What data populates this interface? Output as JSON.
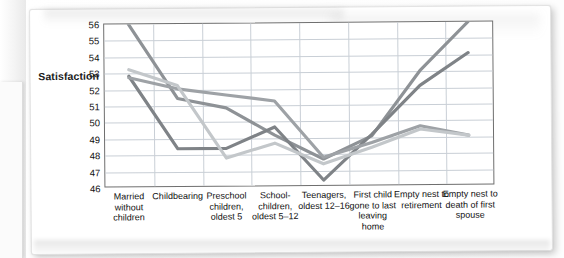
{
  "axis_title": "Satisfaction",
  "chart_data": {
    "type": "line",
    "title": "",
    "xlabel": "",
    "ylabel": "Satisfaction",
    "ylim": [
      46,
      56
    ],
    "yticks": [
      46,
      47,
      48,
      49,
      50,
      51,
      52,
      53,
      54,
      55,
      56
    ],
    "grid": true,
    "legend": "none",
    "categories": [
      "Married without children",
      "Childbearing",
      "Preschool children, oldest 5",
      "School-children, oldest 5–12",
      "Teenagers, oldest 12–16",
      "First child gone to last leaving home",
      "Empty nest to retirement",
      "Empty nest to death of first spouse"
    ],
    "series": [
      {
        "name": "series-1",
        "color": "#8e9296",
        "values": [
          56.0,
          51.4,
          50.8,
          49.1,
          47.6,
          49.0,
          53.0,
          56.0
        ]
      },
      {
        "name": "series-2",
        "color": "#7f8387",
        "values": [
          52.8,
          48.3,
          48.3,
          49.6,
          46.3,
          49.1,
          52.1,
          54.1
        ]
      },
      {
        "name": "series-3",
        "color": "#9ea2a6",
        "values": [
          52.7,
          52.0,
          51.6,
          51.2,
          47.7,
          48.6,
          49.6,
          49.0
        ]
      },
      {
        "name": "series-4",
        "color": "#c3c7ca",
        "values": [
          53.2,
          52.2,
          47.7,
          48.6,
          47.3,
          48.3,
          49.4,
          49.0
        ]
      }
    ]
  }
}
